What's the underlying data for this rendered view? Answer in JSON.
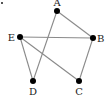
{
  "diagram": {
    "type": "graph",
    "nodes": [
      {
        "id": "A",
        "label": "A",
        "x": 57,
        "y": 11
      },
      {
        "id": "B",
        "label": "B",
        "x": 93,
        "y": 38
      },
      {
        "id": "C",
        "label": "C",
        "x": 79,
        "y": 81
      },
      {
        "id": "D",
        "label": "D",
        "x": 33,
        "y": 81
      },
      {
        "id": "E",
        "label": "E",
        "x": 20,
        "y": 37
      }
    ],
    "edges": [
      [
        "A",
        "B"
      ],
      [
        "A",
        "D"
      ],
      [
        "E",
        "B"
      ],
      [
        "E",
        "D"
      ],
      [
        "E",
        "C"
      ],
      [
        "B",
        "C"
      ]
    ],
    "colors": {
      "edge": "#8a8a8a",
      "node": "#000000",
      "label": "#222222"
    }
  }
}
